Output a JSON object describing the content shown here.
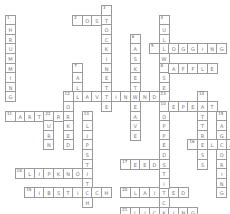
{
  "puzzle": {
    "cell_px": 9.6,
    "origin": [
      5,
      5
    ],
    "words": [
      {
        "num": "1",
        "dir": "down",
        "row": 1,
        "col": 0,
        "text": "SHRUMMING"
      },
      {
        "num": "2",
        "dir": "across",
        "row": 1,
        "col": 7,
        "text": "POST"
      },
      {
        "num": "3",
        "dir": "down",
        "row": 0,
        "col": 10,
        "text": "STOCKINETTE"
      },
      {
        "num": "4",
        "dir": "down",
        "row": 1,
        "col": 16,
        "text": "BULLWISE"
      },
      {
        "num": "5",
        "dir": "across",
        "row": 4,
        "col": 15,
        "text": "BROGGING"
      },
      {
        "num": "6",
        "dir": "down",
        "row": 3,
        "col": 13,
        "text": "BASKETWEAVE"
      },
      {
        "num": "7",
        "dir": "down",
        "row": 6,
        "col": 7,
        "text": "WALL"
      },
      {
        "num": "8",
        "dir": "across",
        "row": 6,
        "col": 16,
        "text": "WAFFLE"
      },
      {
        "num": "9",
        "dir": "across",
        "row": 9,
        "col": 6,
        "text": "WEAVEINENDS"
      },
      {
        "num": "10",
        "dir": "across",
        "row": 10,
        "col": 16,
        "text": "REPEAT"
      },
      {
        "num": "11",
        "dir": "across",
        "row": 11,
        "col": 0,
        "text": "GARTER"
      },
      {
        "num": "12",
        "dir": "down",
        "row": 9,
        "col": 6,
        "text": "WORKED"
      },
      {
        "num": "13",
        "dir": "down",
        "row": 11,
        "col": 8,
        "text": "SLIPSTITCH"
      },
      {
        "num": "14",
        "dir": "down",
        "row": 9,
        "col": 20,
        "text": "MATTRESS"
      },
      {
        "num": "15",
        "dir": "down",
        "row": 11,
        "col": 22,
        "text": "BAGCORING"
      },
      {
        "num": "16",
        "dir": "across",
        "row": 14,
        "col": 19,
        "text": "WELIA"
      },
      {
        "num": "17",
        "dir": "across",
        "row": 16,
        "col": 12,
        "text": "SEED"
      },
      {
        "num": "18",
        "dir": "across",
        "row": 17,
        "col": 1,
        "text": "SLIPKNOT"
      },
      {
        "num": "19",
        "dir": "across",
        "row": 19,
        "col": 2,
        "text": "RIBSTITCH"
      },
      {
        "num": "20",
        "dir": "across",
        "row": 19,
        "col": 12,
        "text": "PLAITED"
      },
      {
        "num": "21",
        "dir": "across",
        "row": 21,
        "col": 12,
        "text": "PLICKING"
      },
      {
        "num": "22",
        "dir": "down",
        "row": 11,
        "col": 4,
        "text": "TURN"
      },
      {
        "num": "23",
        "dir": "down",
        "row": 9,
        "col": 16,
        "text": "SWOPPEDSTITCH"
      }
    ]
  }
}
